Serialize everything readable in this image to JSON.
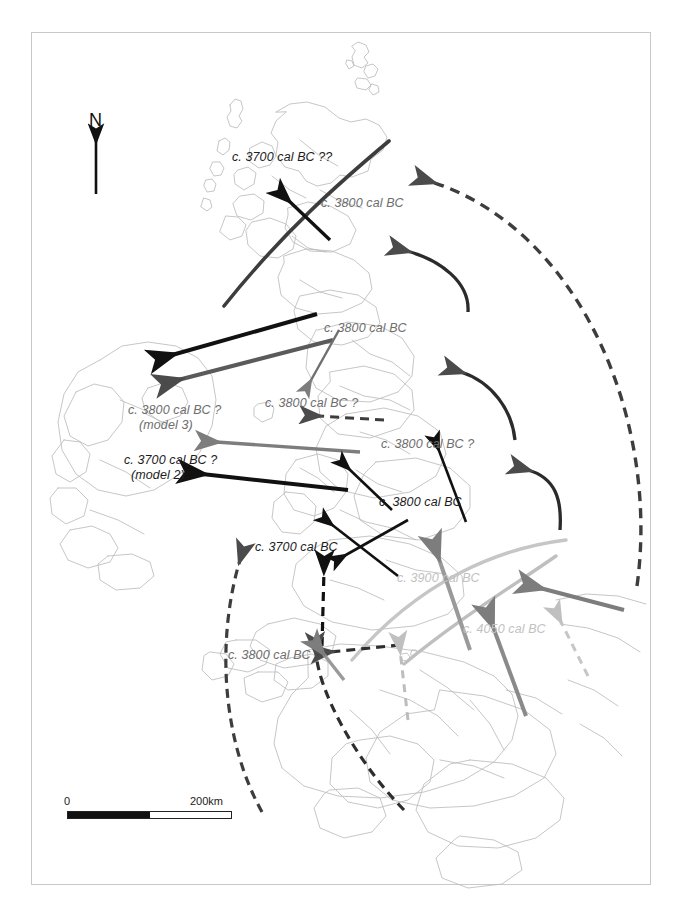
{
  "figure": {
    "kind": "archaeological-diffusion-map",
    "region": "Britain, Ireland and northern France",
    "background": "#ffffff",
    "frame_color": "#c9c9c9"
  },
  "north_arrow": {
    "label": "N"
  },
  "scale_bar": {
    "min_label": "0",
    "max_label": "200km"
  },
  "colors": {
    "black": "#111111",
    "dark_gray": "#4f4f4f",
    "mid_gray": "#7d7d7d",
    "light_gray": "#bdbdbd",
    "coastline": "#b9b9b9",
    "frame": "#c9c9c9"
  },
  "labels": [
    {
      "id": "scotland-north",
      "text": "c. 3700 cal BC ??",
      "tone": "dark",
      "x": 232,
      "y": 150
    },
    {
      "id": "scotland-east",
      "text": "c. 3800 cal BC",
      "tone": "mid",
      "x": 321,
      "y": 196
    },
    {
      "id": "northern-england",
      "text": "c. 3800 cal BC",
      "tone": "mid",
      "x": 324,
      "y": 321
    },
    {
      "id": "ireland-model3-line1",
      "text": "c. 3800 cal BC ?",
      "tone": "mid",
      "x": 128,
      "y": 403
    },
    {
      "id": "ireland-model3-line2",
      "text": "(model 3)",
      "tone": "mid",
      "x": 139,
      "y": 418
    },
    {
      "id": "isle-of-man",
      "text": "c. 3800 cal BC ?",
      "tone": "mid",
      "x": 265,
      "y": 396
    },
    {
      "id": "ireland-model2-line1",
      "text": "c. 3700 cal BC ?",
      "tone": "dark",
      "x": 124,
      "y": 453
    },
    {
      "id": "ireland-model2-line2",
      "text": "(model 2)",
      "tone": "dark",
      "x": 131,
      "y": 468
    },
    {
      "id": "midlands",
      "text": "c. 3800 cal BC ?",
      "tone": "mid",
      "x": 381,
      "y": 437
    },
    {
      "id": "wales-east",
      "text": "c. 3800 cal BC",
      "tone": "dark",
      "x": 379,
      "y": 495
    },
    {
      "id": "wales-west",
      "text": "c. 3700 cal BC",
      "tone": "dark",
      "x": 255,
      "y": 540
    },
    {
      "id": "southern-england",
      "text": "c. 3900 cal BC",
      "tone": "light",
      "x": 397,
      "y": 571
    },
    {
      "id": "brittany",
      "text": "c. 3800 cal BC",
      "tone": "mid",
      "x": 228,
      "y": 648
    },
    {
      "id": "channel",
      "text": "c. 4050 cal BC",
      "tone": "light",
      "x": 463,
      "y": 622
    }
  ],
  "flow_arrows": [
    {
      "id": "arrow-to-west-scotland",
      "style": "solid",
      "tone": "black"
    },
    {
      "id": "arc-scotland-boundary",
      "style": "solid-arc",
      "tone": "dark"
    },
    {
      "id": "arrow-to-north-ireland-black",
      "style": "solid",
      "tone": "black"
    },
    {
      "id": "arrow-to-north-ireland-gray",
      "style": "solid",
      "tone": "mid"
    },
    {
      "id": "arrow-to-isle-of-man",
      "style": "solid",
      "tone": "mid"
    },
    {
      "id": "arrow-to-cumbria-dashed",
      "style": "dashed",
      "tone": "dark"
    },
    {
      "id": "arrow-to-ireland-model3",
      "style": "solid",
      "tone": "mid"
    },
    {
      "id": "arrow-to-ireland-model2",
      "style": "solid",
      "tone": "black"
    },
    {
      "id": "arrow-to-midlands",
      "style": "solid",
      "tone": "black"
    },
    {
      "id": "arrow-to-wales",
      "style": "solid",
      "tone": "black"
    },
    {
      "id": "arrow-to-wales-short",
      "style": "solid",
      "tone": "black"
    },
    {
      "id": "arrow-to-west-wales-dashed",
      "style": "dashed",
      "tone": "black"
    },
    {
      "id": "arrow-to-brittany-dashed",
      "style": "dashed",
      "tone": "dark"
    },
    {
      "id": "arrow-brittany-inland-dashed",
      "style": "dashed",
      "tone": "dark"
    },
    {
      "id": "arrow-to-sw-ireland-long-dashed",
      "style": "dashed",
      "tone": "dark"
    },
    {
      "id": "arrow-north-sea-curve-upper",
      "style": "curved",
      "tone": "dark"
    },
    {
      "id": "arrow-north-sea-curve-mid",
      "style": "curved",
      "tone": "dark"
    },
    {
      "id": "arrow-north-sea-curve-lower",
      "style": "curved",
      "tone": "dark"
    },
    {
      "id": "arrow-long-dashed-east",
      "style": "dashed-arc",
      "tone": "dark"
    },
    {
      "id": "arrow-channel-from-east",
      "style": "solid",
      "tone": "mid"
    },
    {
      "id": "arrow-channel-north",
      "style": "solid",
      "tone": "mid"
    },
    {
      "id": "arrow-channel-northwest",
      "style": "solid",
      "tone": "mid"
    },
    {
      "id": "arrow-channel-light-dashed",
      "style": "dashed",
      "tone": "light"
    },
    {
      "id": "arc-light-southwest",
      "style": "arc",
      "tone": "light"
    },
    {
      "id": "arc-light-southeast",
      "style": "arc",
      "tone": "mid"
    }
  ]
}
